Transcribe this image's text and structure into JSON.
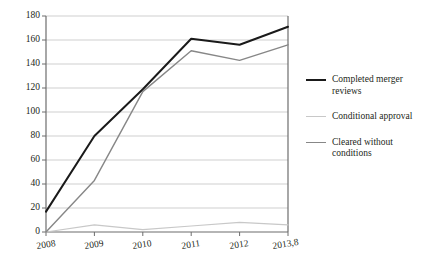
{
  "chart_data": {
    "type": "line",
    "title": "",
    "xlabel": "",
    "ylabel": "",
    "categories": [
      "2008",
      "2009",
      "2010",
      "2011",
      "2012",
      "2013,8"
    ],
    "ylim": [
      0,
      180
    ],
    "yticks": [
      0,
      20,
      40,
      60,
      80,
      100,
      120,
      140,
      160,
      180
    ],
    "grid": true,
    "legend_position": "right",
    "series": [
      {
        "name": "Completed merger reviews",
        "color": "#1a1a1a",
        "width": 2.0,
        "values": [
          17,
          80,
          119,
          161,
          156,
          171
        ]
      },
      {
        "name": "Conditional approval",
        "color": "#c8c8c8",
        "width": 1.2,
        "values": [
          0,
          6,
          2,
          5,
          8,
          6
        ]
      },
      {
        "name": "Cleared without conditions",
        "color": "#878787",
        "width": 1.4,
        "values": [
          0,
          43,
          117,
          151,
          143,
          156
        ]
      }
    ]
  },
  "axes": {
    "ytick_labels": [
      "180",
      "160",
      "140",
      "120",
      "100",
      "80",
      "60",
      "40",
      "20",
      "0"
    ],
    "xtick_labels": [
      "2008",
      "2009",
      "2010",
      "2011",
      "2012",
      "2013,8"
    ]
  },
  "legend": {
    "entries": [
      {
        "label": "Completed merger reviews",
        "color": "#1a1a1a",
        "width": "2px"
      },
      {
        "label": "Conditional approval",
        "color": "#c8c8c8",
        "width": "1.5px"
      },
      {
        "label": "Cleared without conditions",
        "color": "#878787",
        "width": "1.5px"
      }
    ]
  },
  "colors": {
    "axis": "#6d6d6d",
    "grid": "#c9c9c9",
    "text": "#231f20",
    "background": "#ffffff"
  }
}
